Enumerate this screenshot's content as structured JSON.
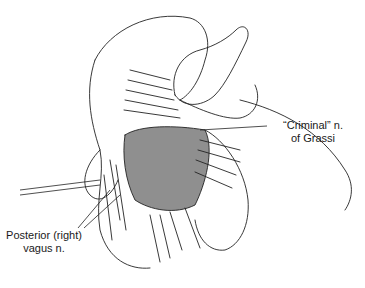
{
  "figure": {
    "labels": [
      {
        "line1": "“Criminal” n.",
        "line2": "of Grassi"
      },
      {
        "line1": "Posterior (right)",
        "line2": "vagus n."
      }
    ]
  }
}
